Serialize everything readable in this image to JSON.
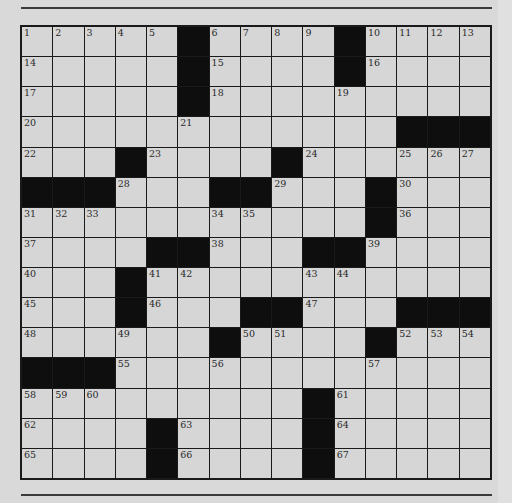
{
  "puzzle": {
    "rows": 15,
    "cols": 15,
    "colors": {
      "white_cell": "#d6d6d6",
      "black_cell": "#0e0e0e",
      "background": "#d9d9d9",
      "rule": "#3a3a3a"
    },
    "grid": [
      [
        "1",
        "2",
        "3",
        "4",
        "5",
        "#",
        "6",
        "7",
        "8",
        "9",
        "#",
        "10",
        "11",
        "12",
        "13"
      ],
      [
        "14",
        "",
        "",
        "",
        "",
        "#",
        "15",
        "",
        "",
        "",
        "#",
        "16",
        "",
        "",
        ""
      ],
      [
        "17",
        "",
        "",
        "",
        "",
        "#",
        "18",
        "",
        "",
        "",
        "19",
        "",
        "",
        "",
        ""
      ],
      [
        "20",
        "",
        "",
        "",
        "",
        "21",
        "",
        "",
        "",
        "",
        "",
        "",
        "#",
        "#",
        "#"
      ],
      [
        "22",
        "",
        "",
        "#",
        "23",
        "",
        "",
        "",
        "#",
        "24",
        "",
        "",
        "25",
        "26",
        "27"
      ],
      [
        "#",
        "#",
        "#",
        "28",
        "",
        "",
        "#",
        "#",
        "29",
        "",
        "",
        "#",
        "30",
        "",
        ""
      ],
      [
        "31",
        "32",
        "33",
        "",
        "",
        "",
        "34",
        "35",
        "",
        "",
        "",
        "#",
        "36",
        "",
        ""
      ],
      [
        "37",
        "",
        "",
        "",
        "#",
        "#",
        "38",
        "",
        "",
        "#",
        "#",
        "39",
        "",
        "",
        ""
      ],
      [
        "40",
        "",
        "",
        "#",
        "41",
        "42",
        "",
        "",
        "",
        "43",
        "44",
        "",
        "",
        "",
        ""
      ],
      [
        "45",
        "",
        "",
        "#",
        "46",
        "",
        "",
        "#",
        "#",
        "47",
        "",
        "",
        "#",
        "#",
        "#"
      ],
      [
        "48",
        "",
        "",
        "49",
        "",
        "",
        "#",
        "50",
        "51",
        "",
        "",
        "#",
        "52",
        "53",
        "54"
      ],
      [
        "#",
        "#",
        "#",
        "55",
        "",
        "",
        "56",
        "",
        "",
        "",
        "",
        "57",
        "",
        "",
        ""
      ],
      [
        "58",
        "59",
        "60",
        "",
        "",
        "",
        "",
        "",
        "",
        "#",
        "61",
        "",
        "",
        "",
        ""
      ],
      [
        "62",
        "",
        "",
        "",
        "#",
        "63",
        "",
        "",
        "",
        "#",
        "64",
        "",
        "",
        "",
        ""
      ],
      [
        "65",
        "",
        "",
        "",
        "#",
        "66",
        "",
        "",
        "",
        "#",
        "67",
        "",
        "",
        "",
        ""
      ]
    ]
  }
}
